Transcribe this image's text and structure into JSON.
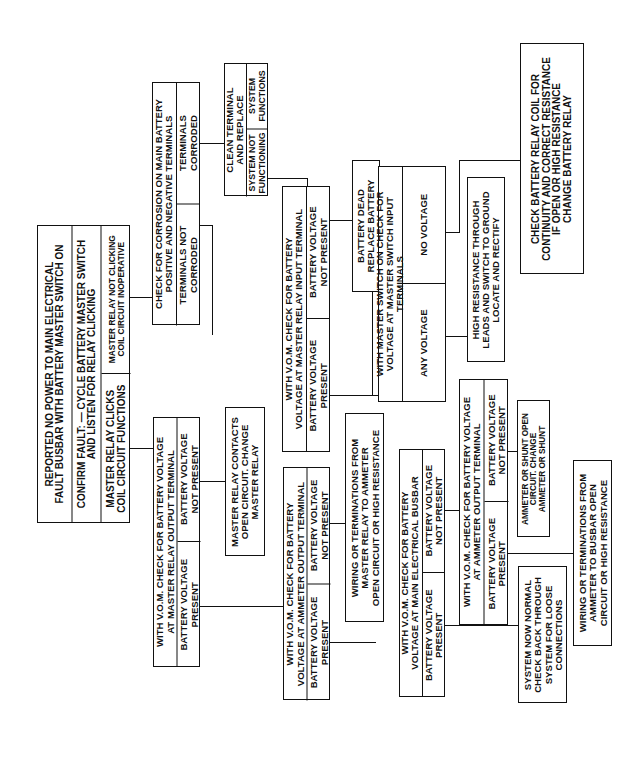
{
  "flowchart": {
    "start": {
      "header": "REPORTED NO POWER TO MAIN ELECTRICAL\nFAULT BUSBAR WITH BATTERY MASTER SWITCH ON",
      "confirm": "CONFIRM FAULT: — CYCLE BATTERY MASTER SWITCH\nAND LISTEN FOR RELAY CLICKING",
      "option_a": "MASTER RELAY CLICKS\nCOIL CIRCUIT FUNCTIONS",
      "option_b": "MASTER RELAY NOT CLICKING\nCOIL CIRCUIT INOPERATIVE"
    },
    "corrosion_check": {
      "header": "CHECK FOR CORROSION ON MAIN BATTERY\nPOSITIVE AND NEGATIVE TERMINALS",
      "option_a": "TERMINALS NOT\nCORRODED",
      "option_b": "TERMINALS\nCORRODED"
    },
    "clean_terminal": {
      "header": "CLEAN TERMINAL\nAND REPLACE",
      "option_a": "SYSTEM NOT\nFUNCTIONING",
      "option_b": "SYSTEM\nFUNCTIONS"
    },
    "relay_input_check": {
      "header": "WITH V.O.M. CHECK FOR BATTERY\nVOLTAGE AT MASTER RELAY INPUT TERMINAL",
      "option_a": "BATTERY VOLTAGE\nPRESENT",
      "option_b": "BATTERY VOLTAGE\nNOT PRESENT"
    },
    "battery_dead": {
      "text": "BATTERY DEAD\nREPLACE BATTERY"
    },
    "master_switch_check": {
      "header": "WITH MASTER SWITCH ON CHECK FOR\nVOLTAGE AT MASTER SWITCH INPUT TERMINALS",
      "option_a": "ANY VOLTAGE",
      "option_b": "NO VOLTAGE"
    },
    "high_resistance": {
      "text": "HIGH RESISTANCE THROUGH\nLEADS AND SWITCH TO GROUND\nLOCATE AND RECTIFY"
    },
    "battery_relay_coil": {
      "text": "CHECK BATTERY RELAY COIL FOR\nCONTINUITY AND CORRECT RESISTANCE\nIF OPEN OR HIGH RESISTANCE\nCHANGE BATTERY RELAY"
    },
    "relay_output_check": {
      "header": "WITH V.O.M. CHECK FOR BATTERY VOLTAGE\nAT MASTER RELAY OUTPUT TERMINAL",
      "option_a": "BATTERY VOLTAGE\nPRESENT",
      "option_b": "BATTERY VOLTAGE\nNOT PRESENT"
    },
    "relay_contacts_open": {
      "text": "MASTER RELAY CONTACTS\nOPEN CIRCUIT. CHANGE\nMASTER RELAY"
    },
    "ammeter_output_check_1": {
      "header": "WITH V.O.M. CHECK FOR BATTERY\nVOLTAGE AT AMMETER OUTPUT TERMINAL",
      "option_a": "BATTERY VOLTAGE\nPRESENT",
      "option_b": "BATTERY VOLTAGE\nNOT PRESENT"
    },
    "wiring_relay_to_ammeter": {
      "text": "WIRING OR TERMINATIONS FROM\nMASTER RELAY TO AMMETER\nOPEN CIRCUIT OR HIGH RESISTANCE"
    },
    "busbar_check": {
      "header": "WITH V.O.M. CHECK FOR BATTERY\nVOLTAGE AT MAIN ELECTRICAL BUSBAR",
      "option_a": "BATTERY VOLTAGE\nPRESENT",
      "option_b": "BATTERY VOLTAGE\nNOT PRESENT"
    },
    "ammeter_output_check_2": {
      "header": "WITH V.O.M. CHECK FOR BATTERY VOLTAGE\nAT AMMETER OUTPUT TERMINAL",
      "option_a": "BATTERY VOLTAGE\nPRESENT",
      "option_b": "BATTERY VOLTAGE\nNOT PRESENT"
    },
    "ammeter_shunt_open": {
      "text": "AMMETER OR SHUNT OPEN\nCIRCUIT. CHANGE\nAMMETER OR SHUNT"
    },
    "system_normal": {
      "text": "SYSTEM NOW NORMAL\nCHECK BACK THROUGH\nSYSTEM FOR LOOSE\nCONNECTIONS"
    },
    "wiring_ammeter_to_busbar": {
      "text": "WIRING OR TERMINATIONS FROM\nAMMETER TO BUSBAR OPEN\nCIRCUIT OR HIGH RESISTANCE"
    }
  }
}
